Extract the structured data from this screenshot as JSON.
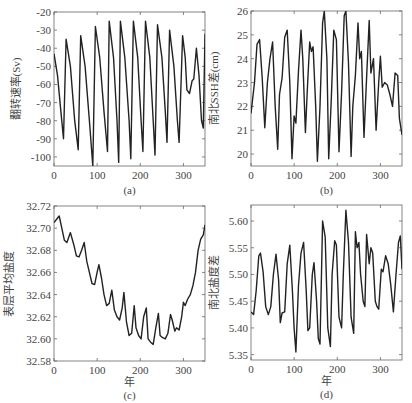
{
  "chart_data": [
    {
      "id": "a",
      "type": "line",
      "caption": "(a)",
      "title": "",
      "xlabel": "",
      "ylabel": "翻转速率(Sv)",
      "xlim": [
        0,
        350
      ],
      "ylim": [
        -105,
        -20
      ],
      "xticks": [
        0,
        100,
        200,
        300
      ],
      "yticks": [
        -20,
        -30,
        -40,
        -50,
        -60,
        -70,
        -80,
        -90,
        -100
      ],
      "ytick_labels": [
        "-20",
        "-30",
        "-40",
        "-50",
        "-60",
        "-70",
        "-80",
        "-90",
        "-100"
      ],
      "grid": false,
      "series": [
        {
          "name": "翻转速率",
          "x": [
            0,
            8,
            16,
            22,
            28,
            38,
            48,
            56,
            62,
            72,
            82,
            90,
            96,
            106,
            116,
            124,
            128,
            138,
            146,
            150,
            154,
            164,
            174,
            178,
            184,
            194,
            202,
            206,
            212,
            222,
            230,
            234,
            240,
            250,
            258,
            262,
            268,
            278,
            286,
            290,
            298,
            304,
            308,
            314,
            320,
            324,
            330,
            336,
            342,
            346,
            350
          ],
          "y": [
            -43,
            -55,
            -75,
            -90,
            -35,
            -50,
            -80,
            -96,
            -33,
            -50,
            -80,
            -105,
            -28,
            -45,
            -75,
            -97,
            -25,
            -45,
            -80,
            -103,
            -25,
            -45,
            -80,
            -101,
            -25,
            -45,
            -80,
            -97,
            -25,
            -45,
            -80,
            -99,
            -27,
            -45,
            -75,
            -92,
            -30,
            -50,
            -80,
            -92,
            -33,
            -45,
            -63,
            -65,
            -58,
            -57,
            -40,
            -55,
            -80,
            -84,
            -32
          ]
        }
      ]
    },
    {
      "id": "b",
      "type": "line",
      "caption": "(b)",
      "title": "",
      "xlabel": "",
      "ylabel": "南北SSH差(cm)",
      "xlim": [
        0,
        350
      ],
      "ylim": [
        19.5,
        26
      ],
      "xticks": [
        0,
        100,
        200,
        300
      ],
      "yticks": [
        20,
        21,
        22,
        23,
        24,
        25,
        26
      ],
      "ytick_labels": [
        "20",
        "21",
        "22",
        "23",
        "24",
        "25",
        "26"
      ],
      "grid": false,
      "series": [
        {
          "name": "南北SSH差",
          "x": [
            0,
            8,
            14,
            20,
            26,
            32,
            38,
            44,
            50,
            56,
            62,
            66,
            72,
            78,
            84,
            90,
            95,
            100,
            104,
            110,
            116,
            120,
            126,
            130,
            136,
            140,
            144,
            150,
            154,
            160,
            166,
            170,
            176,
            180,
            186,
            192,
            198,
            204,
            210,
            216,
            220,
            226,
            232,
            236,
            242,
            248,
            252,
            256,
            262,
            268,
            274,
            278,
            284,
            290,
            296,
            300,
            304,
            310,
            316,
            322,
            328,
            334,
            340,
            344,
            350
          ],
          "y": [
            21.7,
            23.0,
            24.6,
            24.8,
            23.2,
            21.1,
            23.0,
            24.0,
            24.7,
            22.0,
            20.2,
            22.5,
            23.2,
            24.9,
            25.2,
            23.0,
            19.8,
            21.6,
            21.3,
            23.5,
            25.2,
            24.0,
            20.9,
            22.5,
            24.7,
            24.3,
            24.5,
            22.0,
            19.7,
            22.0,
            25.5,
            26.0,
            24.0,
            19.8,
            22.2,
            25.2,
            24.8,
            20.1,
            22.6,
            25.8,
            26.0,
            23.8,
            19.9,
            22.0,
            23.3,
            25.5,
            24.0,
            24.3,
            20.7,
            23.2,
            25.6,
            23.4,
            24.0,
            21.0,
            23.0,
            24.1,
            22.8,
            23.0,
            22.9,
            22.5,
            22.0,
            23.4,
            23.3,
            21.5,
            20.8
          ]
        }
      ]
    },
    {
      "id": "c",
      "type": "line",
      "caption": "(c)",
      "title": "",
      "xlabel": "年",
      "ylabel": "表层平均盐度",
      "xlim": [
        0,
        350
      ],
      "ylim": [
        32.58,
        32.72
      ],
      "xticks": [
        0,
        100,
        200,
        300
      ],
      "yticks": [
        32.58,
        32.6,
        32.62,
        32.64,
        32.66,
        32.68,
        32.7,
        32.72
      ],
      "ytick_labels": [
        "32.58",
        "32.60",
        "32.62",
        "32.64",
        "32.66",
        "32.68",
        "32.70",
        "32.72"
      ],
      "grid": false,
      "series": [
        {
          "name": "表层平均盐度",
          "x": [
            0,
            6,
            12,
            18,
            24,
            30,
            38,
            46,
            52,
            58,
            64,
            70,
            76,
            82,
            88,
            94,
            100,
            104,
            110,
            116,
            122,
            128,
            134,
            140,
            146,
            152,
            158,
            162,
            168,
            174,
            180,
            186,
            190,
            196,
            202,
            208,
            214,
            218,
            224,
            230,
            236,
            242,
            246,
            252,
            258,
            264,
            270,
            274,
            280,
            284,
            290,
            296,
            300,
            304,
            310,
            316,
            322,
            328,
            334,
            340,
            346,
            350
          ],
          "y": [
            32.705,
            32.708,
            32.711,
            32.7,
            32.689,
            32.687,
            32.696,
            32.685,
            32.675,
            32.674,
            32.68,
            32.687,
            32.67,
            32.66,
            32.65,
            32.649,
            32.66,
            32.667,
            32.655,
            32.64,
            32.63,
            32.632,
            32.644,
            32.626,
            32.62,
            32.617,
            32.628,
            32.642,
            32.615,
            32.603,
            32.605,
            32.63,
            32.61,
            32.603,
            32.6,
            32.62,
            32.628,
            32.6,
            32.597,
            32.595,
            32.61,
            32.623,
            32.603,
            32.601,
            32.6,
            32.605,
            32.622,
            32.617,
            32.607,
            32.61,
            32.608,
            32.62,
            32.633,
            32.63,
            32.636,
            32.64,
            32.648,
            32.66,
            32.68,
            32.69,
            32.694,
            32.703
          ]
        }
      ]
    },
    {
      "id": "d",
      "type": "line",
      "caption": "(d)",
      "title": "",
      "xlabel": "年",
      "ylabel": "南北盐度差",
      "xlim": [
        0,
        350
      ],
      "ylim": [
        5.34,
        5.63
      ],
      "xticks": [
        0,
        100,
        200,
        300
      ],
      "yticks": [
        5.35,
        5.4,
        5.45,
        5.5,
        5.55,
        5.6
      ],
      "ytick_labels": [
        "5.35",
        "5.40",
        "5.45",
        "5.50",
        "5.55",
        "5.60"
      ],
      "grid": false,
      "series": [
        {
          "name": "南北盐度差",
          "x": [
            0,
            6,
            12,
            18,
            22,
            28,
            34,
            40,
            46,
            52,
            58,
            64,
            68,
            72,
            78,
            84,
            90,
            96,
            100,
            104,
            110,
            116,
            122,
            128,
            132,
            136,
            142,
            146,
            152,
            156,
            160,
            166,
            172,
            178,
            184,
            188,
            194,
            198,
            204,
            210,
            214,
            220,
            226,
            232,
            238,
            242,
            246,
            250,
            254,
            260,
            264,
            268,
            274,
            278,
            282,
            288,
            292,
            296,
            302,
            306,
            312,
            318,
            324,
            330,
            336,
            342,
            346,
            350
          ],
          "y": [
            5.43,
            5.425,
            5.47,
            5.535,
            5.54,
            5.505,
            5.44,
            5.425,
            5.44,
            5.5,
            5.538,
            5.49,
            5.41,
            5.428,
            5.43,
            5.52,
            5.555,
            5.47,
            5.4,
            5.355,
            5.48,
            5.54,
            5.56,
            5.47,
            5.395,
            5.4,
            5.5,
            5.522,
            5.45,
            5.38,
            5.37,
            5.6,
            5.57,
            5.4,
            5.365,
            5.5,
            5.563,
            5.555,
            5.42,
            5.4,
            5.5,
            5.62,
            5.56,
            5.42,
            5.39,
            5.58,
            5.55,
            5.56,
            5.5,
            5.45,
            5.44,
            5.575,
            5.52,
            5.55,
            5.54,
            5.45,
            5.44,
            5.435,
            5.51,
            5.505,
            5.535,
            5.52,
            5.48,
            5.43,
            5.5,
            5.56,
            5.572,
            5.51
          ]
        }
      ]
    }
  ],
  "panels_layout": [
    {
      "id": "a",
      "x0": 54,
      "x1": 205,
      "y0": 12,
      "y1": 166
    },
    {
      "id": "b",
      "x0": 251,
      "x1": 402,
      "y0": 11,
      "y1": 166
    },
    {
      "id": "c",
      "x0": 54,
      "x1": 205,
      "y0": 206,
      "y1": 361
    },
    {
      "id": "d",
      "x0": 251,
      "x1": 402,
      "y0": 205,
      "y1": 360
    }
  ],
  "style": {
    "line_color": "#222222",
    "axis_color": "#666666",
    "text_color": "#444444"
  }
}
